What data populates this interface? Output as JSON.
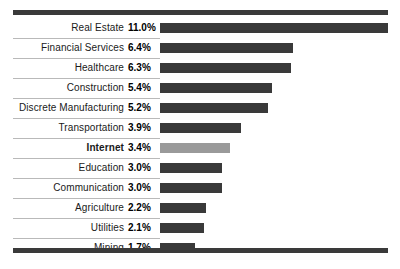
{
  "chart_data": {
    "type": "bar",
    "orientation": "horizontal",
    "title": "",
    "subtitle": "",
    "xlabel": "",
    "ylabel": "",
    "xlim": [
      0,
      11.0
    ],
    "grid": false,
    "legend": false,
    "value_suffix": "%",
    "highlight_category": "Internet",
    "colors": {
      "bar": "#3a3a3a",
      "bar_highlight": "#9a9a9a",
      "rule": "#3a3a3a",
      "separator": "#b9b9b9",
      "label_text": "#1a1a1a",
      "value_text": "#000000",
      "background": "#ffffff"
    },
    "categories": [
      "Real Estate",
      "Financial Services",
      "Healthcare",
      "Construction",
      "Discrete Manufacturing",
      "Transportation",
      "Internet",
      "Education",
      "Communication",
      "Agriculture",
      "Utilities",
      "Mining"
    ],
    "values": [
      11.0,
      6.4,
      6.3,
      5.4,
      5.2,
      3.9,
      3.4,
      3.0,
      3.0,
      2.2,
      2.1,
      1.7
    ],
    "value_labels": [
      "11.0%",
      "6.4%",
      "6.3%",
      "5.4%",
      "5.2%",
      "3.9%",
      "3.4%",
      "3.0%",
      "3.0%",
      "2.2%",
      "2.1%",
      "1.7%"
    ],
    "rows": [
      {
        "label": "Real Estate",
        "value": 11.0,
        "value_label": "11.0%",
        "highlight": false
      },
      {
        "label": "Financial Services",
        "value": 6.4,
        "value_label": "6.4%",
        "highlight": false
      },
      {
        "label": "Healthcare",
        "value": 6.3,
        "value_label": "6.3%",
        "highlight": false
      },
      {
        "label": "Construction",
        "value": 5.4,
        "value_label": "5.4%",
        "highlight": false
      },
      {
        "label": "Discrete Manufacturing",
        "value": 5.2,
        "value_label": "5.2%",
        "highlight": false
      },
      {
        "label": "Transportation",
        "value": 3.9,
        "value_label": "3.9%",
        "highlight": false
      },
      {
        "label": "Internet",
        "value": 3.4,
        "value_label": "3.4%",
        "highlight": true
      },
      {
        "label": "Education",
        "value": 3.0,
        "value_label": "3.0%",
        "highlight": false
      },
      {
        "label": "Communication",
        "value": 3.0,
        "value_label": "3.0%",
        "highlight": false
      },
      {
        "label": "Agriculture",
        "value": 2.2,
        "value_label": "2.2%",
        "highlight": false
      },
      {
        "label": "Utilities",
        "value": 2.1,
        "value_label": "2.1%",
        "highlight": false
      },
      {
        "label": "Mining",
        "value": 1.7,
        "value_label": "1.7%",
        "highlight": false
      }
    ]
  }
}
